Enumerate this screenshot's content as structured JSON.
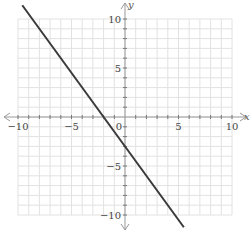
{
  "chart_data": {
    "type": "line",
    "title": "",
    "xlabel": "x",
    "ylabel": "y",
    "xlim": [
      -10,
      10
    ],
    "ylim": [
      -10,
      10
    ],
    "grid": true,
    "grid_step": 1,
    "x_tick_labels": [
      "-10",
      "-5",
      "0",
      "5",
      "10"
    ],
    "y_tick_labels": [
      "10",
      "5",
      "-5",
      "-10"
    ],
    "series": [
      {
        "name": "y = -1.5x - 3",
        "equation": "y = -1.5x - 3",
        "slope": -1.5,
        "intercept": -3,
        "x": [
          -9.6,
          5.5
        ],
        "values": [
          11.4,
          -11.25
        ]
      }
    ],
    "colors": {
      "line": "#3a3a3a",
      "grid": "#e2e2e2",
      "axis": "#999999"
    }
  }
}
